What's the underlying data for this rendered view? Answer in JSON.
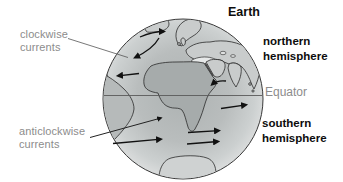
{
  "figure": {
    "title": "Earth",
    "callouts": {
      "clockwise": {
        "line1": "clockwise",
        "line2": "currents"
      },
      "anticlockwise": {
        "line1": "anticlockwise",
        "line2": "currents"
      }
    },
    "region_labels": {
      "northern": {
        "line1": "northern",
        "line2": "hemisphere"
      },
      "equator": "Equator",
      "southern": {
        "line1": "southern",
        "line2": "hemisphere"
      }
    },
    "currents": {
      "northern_hemisphere": "clockwise",
      "southern_hemisphere": "anticlockwise",
      "arrows": [
        {
          "hemisphere": "northern",
          "points": "east",
          "area": "north-atlantic-top"
        },
        {
          "hemisphere": "northern",
          "points": "southwest",
          "area": "north-atlantic-return-curve"
        },
        {
          "hemisphere": "northern",
          "points": "west",
          "area": "mid-atlantic-west"
        },
        {
          "hemisphere": "northern",
          "points": "west",
          "area": "arabian-sea"
        },
        {
          "hemisphere": "southern",
          "points": "east",
          "area": "indian-ocean-near-equator"
        },
        {
          "hemisphere": "southern",
          "points": "northeast",
          "area": "south-atlantic-pointer-arrow"
        },
        {
          "hemisphere": "southern",
          "points": "east",
          "area": "south-atlantic"
        },
        {
          "hemisphere": "southern",
          "points": "east",
          "area": "southern-indian-upper"
        },
        {
          "hemisphere": "southern",
          "points": "east",
          "area": "southern-indian-lower"
        }
      ]
    },
    "colors": {
      "background": "#ffffff",
      "ocean_center": "#adb2b2",
      "ocean_edge": "#dadcdc",
      "land_north": "#c9cccc",
      "land_africa": "#a6abab",
      "land_south_america": "#b6baba",
      "land_antarctica": "#cfd2d2",
      "coast_outline": "#2b2b2b",
      "arrow": "#111111",
      "equator_line": "#5a5a5a",
      "muted_text": "#8c8c8c",
      "bold_text": "#0d0d0d"
    }
  }
}
